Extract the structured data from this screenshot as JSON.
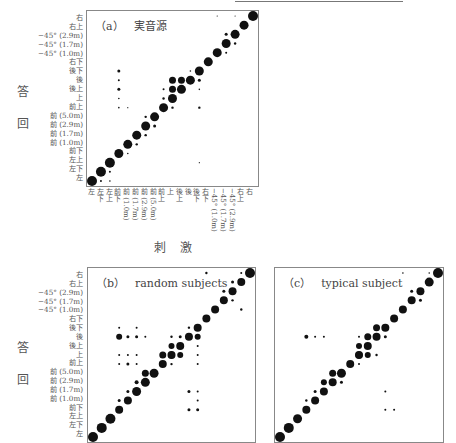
{
  "chart_data": [
    {
      "type": "scatter",
      "subtype": "bubble-confusion-matrix",
      "title": "(a) 実音源",
      "xlabel": "刺 激",
      "ylabel": "回答",
      "categories": [
        "左",
        "左下",
        "左上",
        "前下",
        "前 (1.0m)",
        "前 (1.7m)",
        "前 (2.9m)",
        "前 (5.0m)",
        "前上",
        "上",
        "後上",
        "後",
        "後下",
        "右下",
        "−45° (1.0m)",
        "−45° (1.7m)",
        "−45° (2.9m)",
        "右上",
        "右"
      ],
      "diagonal_dominant": true,
      "notable_off_diagonal": [
        {
          "x": "前下",
          "y": "後下",
          "size": "small"
        },
        {
          "x": "前下",
          "y": "後",
          "size": "tiny"
        },
        {
          "x": "前下",
          "y": "後上",
          "size": "small"
        },
        {
          "x": "前 (5.0m)",
          "y": "前 (2.9m)",
          "size": "small"
        },
        {
          "x": "後",
          "y": "上",
          "size": "small"
        },
        {
          "x": "−45° (1.7m)",
          "y": "−45° (2.9m)",
          "size": "small"
        }
      ]
    },
    {
      "type": "scatter",
      "subtype": "bubble-confusion-matrix",
      "title": "(b) random subjects",
      "ylabel": "回答",
      "categories": [
        "左",
        "左下",
        "左上",
        "前下",
        "前 (1.0m)",
        "前 (1.7m)",
        "前 (2.9m)",
        "前 (5.0m)",
        "前上",
        "上",
        "後上",
        "後",
        "後下",
        "右下",
        "−45° (1.0m)",
        "−45° (1.7m)",
        "−45° (2.9m)",
        "右上",
        "右"
      ],
      "diagonal_dominant": true
    },
    {
      "type": "scatter",
      "subtype": "bubble-confusion-matrix",
      "title": "(c) typical subject",
      "categories": [
        "左",
        "左下",
        "左上",
        "前下",
        "前 (1.0m)",
        "前 (1.7m)",
        "前 (2.9m)",
        "前 (5.0m)",
        "前上",
        "上",
        "後上",
        "後",
        "後下",
        "右下",
        "−45° (1.0m)",
        "−45° (1.7m)",
        "−45° (2.9m)",
        "右上",
        "右"
      ],
      "diagonal_dominant": true
    }
  ],
  "panels": {
    "a": {
      "tag": "（a）",
      "title": "実音源"
    },
    "b": {
      "tag": "（b）",
      "title": "random subjects"
    },
    "c": {
      "tag": "（c）",
      "title": "typical subject"
    }
  },
  "ylabels": [
    "右",
    "右上",
    "−45° (2.9m)",
    "−45° (1.7m)",
    "−45° (1.0m)",
    "右下",
    "後下",
    "後",
    "後上",
    "上",
    "前上",
    "前 (5.0m)",
    "前 (2.9m)",
    "前 (1.7m)",
    "前 (1.0m)",
    "前下",
    "左上",
    "左下",
    "左"
  ],
  "xlabels": [
    "左",
    "左下",
    "左上",
    "前下",
    "前 (1.0m)",
    "前 (1.7m)",
    "前 (2.9m)",
    "前 (5.0m)",
    "前上",
    "上",
    "後上",
    "後",
    "後下",
    "右下",
    "−45° (1.0m)",
    "−45° (1.7m)",
    "−45° (2.9m)",
    "右上",
    "右"
  ],
  "axis": {
    "y_char1": "答",
    "y_char2": "回",
    "x_title": "刺激"
  },
  "colors": {
    "dot": "#111111",
    "frame": "#888888"
  }
}
